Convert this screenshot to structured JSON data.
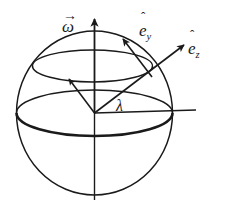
{
  "figure": {
    "background_color": "#ffffff",
    "stroke_color": "#1a1a1a",
    "width": 226,
    "height": 207
  },
  "labels": {
    "omega": {
      "text": "ω",
      "accent": "→",
      "accent_name": "vector-arrow-accent",
      "meaning": "angular-velocity-vector"
    },
    "e_y": {
      "base": "e",
      "subscript": "y",
      "accent": "ˆ",
      "accent_name": "hat-accent",
      "meaning": "unit-vector-east-north-tangent"
    },
    "e_z": {
      "base": "e",
      "subscript": "z",
      "accent": "ˆ",
      "accent_name": "hat-accent",
      "meaning": "unit-vector-radial-outward"
    },
    "lambda": {
      "text": "λ",
      "meaning": "latitude-angle"
    }
  },
  "geometry": {
    "sphere": {
      "center_x": 94.5,
      "center_y": 113,
      "radius_x": 78,
      "radius_y": 82
    },
    "equator": {
      "center_x": 94.5,
      "center_y": 113,
      "radius_x": 78,
      "radius_y": 23,
      "front_arc_thick": true
    },
    "latitude_circle": {
      "center_x": 92.5,
      "center_y": 66,
      "radius_x": 60,
      "radius_y": 16
    },
    "rotation_axis": {
      "x": 94.5,
      "y_top": 17,
      "y_bottom": 200
    },
    "horizontal_reference_line": {
      "x_start": 94.5,
      "y": 113,
      "x_end": 196
    },
    "vectors": [
      {
        "name": "omega-arrow",
        "from_x": 94.5,
        "from_y": 113,
        "to_x": 94.5,
        "to_y": 17
      },
      {
        "name": "e-z-arrow",
        "from_x": 94.5,
        "from_y": 113,
        "to_x": 185,
        "to_y": 44
      },
      {
        "name": "e-y-arrow",
        "from_x": 152,
        "from_y": 77,
        "to_x": 122,
        "to_y": 38
      },
      {
        "name": "unlabeled-inward-arrow",
        "from_x": 94.5,
        "from_y": 113,
        "to_x": 68,
        "to_y": 78
      }
    ]
  }
}
